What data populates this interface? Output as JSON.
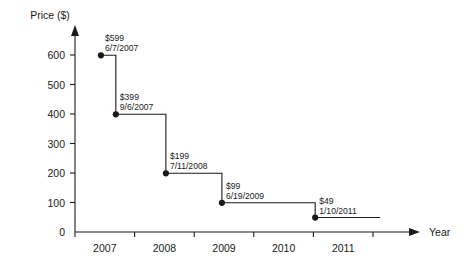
{
  "chart_data": {
    "type": "line",
    "title": "",
    "xlabel": "Year",
    "ylabel": "Price ($)",
    "ylim": [
      0,
      650
    ],
    "xlim": [
      2007,
      2012
    ],
    "grid": false,
    "legend": null,
    "step_style": "post",
    "ytick_labels": [
      "0",
      "100",
      "200",
      "300",
      "400",
      "500",
      "600"
    ],
    "ytick_values": [
      0,
      100,
      200,
      300,
      400,
      500,
      600
    ],
    "xtick_labels": [
      "2007",
      "2008",
      "2009",
      "2010",
      "2011"
    ],
    "xtick_values": [
      2007,
      2008,
      2009,
      2010,
      2011
    ],
    "points": [
      {
        "price": 599,
        "price_label": "$599",
        "date_label": "6/7/2007",
        "x_frac": 0.435,
        "y_value": 599
      },
      {
        "price": 399,
        "price_label": "$399",
        "date_label": "9/6/2007",
        "x_frac": 0.685,
        "y_value": 399
      },
      {
        "price": 199,
        "price_label": "$199",
        "date_label": "7/11/2008",
        "x_frac": 1.525,
        "y_value": 199
      },
      {
        "price": 99,
        "price_label": "$99",
        "date_label": "6/19/2009",
        "x_frac": 2.465,
        "y_value": 99
      },
      {
        "price": 49,
        "price_label": "$49",
        "date_label": "1/10/2011",
        "x_frac": 4.03,
        "y_value": 49
      }
    ],
    "series_end_x_frac": 5.12
  }
}
